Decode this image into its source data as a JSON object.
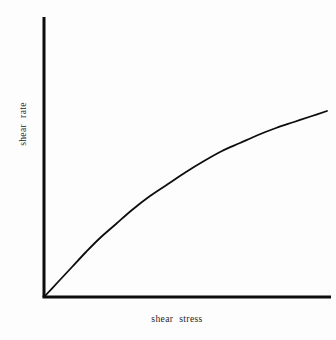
{
  "figure": {
    "background_color": "#fdfdfd",
    "ink_color": "#0d0d0d",
    "text_color": "#262626",
    "width": 336,
    "height": 340
  },
  "chart_data": {
    "type": "line",
    "title": "",
    "xlabel": "shear  stress",
    "ylabel": "shear  rate",
    "grid": false,
    "legend": null,
    "annotations": [],
    "xlim": [
      0,
      100
    ],
    "ylim": [
      0,
      100
    ],
    "xticks": [],
    "yticks": [],
    "xticklabels": [],
    "yticklabels": [],
    "axis_style": {
      "spines": [
        "left",
        "bottom"
      ],
      "left_spine_width_px": 3,
      "bottom_spine_width_px": 3,
      "origin_px": [
        44,
        297
      ],
      "left_spine_top_px": 17,
      "bottom_spine_right_px": 331
    },
    "series": [
      {
        "name": "pseudoplastic (shear thinning) flow curve",
        "line_width_px": 1.8,
        "color": "#0d0d0d",
        "x": [
          0,
          5,
          10,
          15,
          20,
          25,
          30,
          35,
          40,
          45,
          50,
          55,
          60,
          65,
          70,
          75,
          80,
          85,
          90,
          95,
          100
        ],
        "y": [
          0,
          11.1,
          21.0,
          29.8,
          37.7,
          44.7,
          51.0,
          56.6,
          61.6,
          66.1,
          70.0,
          73.6,
          76.7,
          79.6,
          82.1,
          84.3,
          86.3,
          88.1,
          89.7,
          91.1,
          92.4
        ],
        "points_px": [
          [
            44,
            297
          ],
          [
            58,
            282
          ],
          [
            72,
            267
          ],
          [
            86,
            252
          ],
          [
            100,
            238
          ],
          [
            116,
            224
          ],
          [
            132,
            210
          ],
          [
            150,
            196
          ],
          [
            168,
            184
          ],
          [
            186,
            172
          ],
          [
            204,
            161
          ],
          [
            222,
            151
          ],
          [
            240,
            143
          ],
          [
            258,
            135
          ],
          [
            276,
            128
          ],
          [
            294,
            122
          ],
          [
            312,
            116
          ],
          [
            327,
            111
          ]
        ]
      }
    ]
  },
  "labels": {
    "x_axis": "shear  stress",
    "y_axis": "shear  rate"
  }
}
